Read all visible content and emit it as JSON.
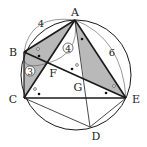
{
  "diagram": {
    "type": "geometry-circle",
    "points": {
      "A": {
        "label": "A",
        "x": 75,
        "y": 20
      },
      "B": {
        "label": "B",
        "x": 24,
        "y": 52
      },
      "C": {
        "label": "C",
        "x": 24,
        "y": 98
      },
      "D": {
        "label": "D",
        "x": 90,
        "y": 127
      },
      "E": {
        "label": "E",
        "x": 126,
        "y": 98
      },
      "F": {
        "label": "F",
        "x": 48,
        "y": 63
      },
      "G": {
        "label": "G",
        "x": 84,
        "y": 79
      }
    },
    "circle": {
      "cx": 76,
      "cy": 75,
      "r": 55
    },
    "arc_labels": {
      "AB": "4",
      "AE": "6"
    },
    "circled_labels": {
      "BF": "3",
      "AF": "4"
    },
    "colors": {
      "shade": "#b9b9b9",
      "line": "#1a1a1a"
    }
  }
}
